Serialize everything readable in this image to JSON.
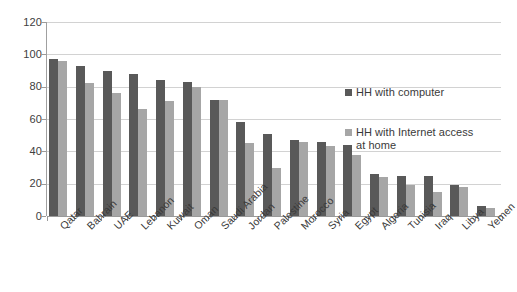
{
  "chart_data": {
    "type": "bar",
    "title": "",
    "subtitle": "",
    "xlabel": "",
    "ylabel": "",
    "ylim": [
      0,
      120
    ],
    "ytick_labels": [
      "0",
      "20",
      "40",
      "60",
      "80",
      "100",
      "120"
    ],
    "yticks": [
      0,
      20,
      40,
      60,
      80,
      100,
      120
    ],
    "grid": true,
    "legend_position": "right",
    "categories": [
      "Qatar",
      "Bahrain",
      "UAE",
      "Lebanon",
      "Kuwait",
      "Oman",
      "Saudi Arabia",
      "Jordan",
      "Palestine",
      "Morocco",
      "Syria",
      "Egypt",
      "Algeria",
      "Tunisia",
      "Iraq",
      "Libya",
      "Yemen"
    ],
    "series": [
      {
        "name": "HH with computer",
        "color": "#595959",
        "values": [
          97,
          93,
          90,
          88,
          84,
          83,
          72,
          58,
          51,
          47,
          46,
          44,
          26,
          25,
          25,
          19,
          6
        ]
      },
      {
        "name": "HH with Internet access at home",
        "color": "#a6a6a6",
        "values": [
          96,
          82,
          76,
          66,
          71,
          80,
          72,
          45,
          30,
          46,
          43,
          38,
          24,
          19,
          15,
          18,
          5
        ]
      }
    ]
  },
  "legend": {
    "entries": [
      {
        "label": "HH with computer"
      },
      {
        "label": "HH with Internet access at home"
      }
    ]
  },
  "colors": {
    "series_a": "#595959",
    "series_b": "#a6a6a6",
    "gridline": "#d2d2d2",
    "axis": "#9a9a9a",
    "text": "#3a3a3a",
    "background": "#ffffff"
  }
}
